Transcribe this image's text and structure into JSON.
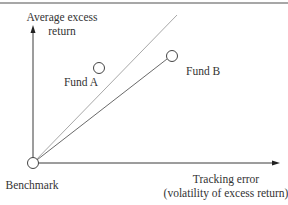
{
  "diagram": {
    "y_axis_label": [
      "Average excess",
      "return"
    ],
    "x_axis_label": [
      "Tracking error",
      "(volatility of excess return)"
    ],
    "points": [
      {
        "id": "benchmark",
        "label": "Benchmark"
      },
      {
        "id": "fund_a",
        "label": "Fund A"
      },
      {
        "id": "fund_b",
        "label": "Fund B"
      }
    ],
    "colors": {
      "axis": "#3a3a3a",
      "line_fund_a": "#9a9a9a",
      "line_fund_b": "#6a6a6a",
      "border": "#8a8a8a"
    }
  }
}
